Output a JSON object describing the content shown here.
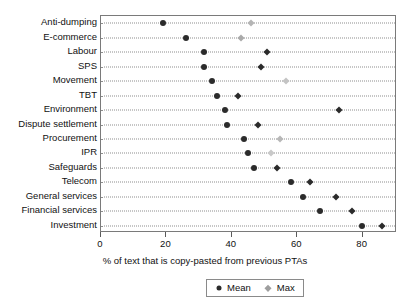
{
  "chart_data": {
    "type": "scatter",
    "title": "",
    "xlabel": "% of text that is copy-pasted from previous PTAs",
    "ylabel": "",
    "xlim": [
      0,
      90.5
    ],
    "xticks": [
      0,
      20,
      40,
      60,
      80
    ],
    "xticklabels": [
      "0",
      "20",
      "40",
      "60",
      "80"
    ],
    "grid": "horizontal-dotted",
    "legend_position": "below-axes-center",
    "categories": [
      "Anti-dumping",
      "E-commerce",
      "Labour",
      "SPS",
      "Movement",
      "TBT",
      "Environment",
      "Dispute settlement",
      "Procurement",
      "IPR",
      "Safeguards",
      "Telecom",
      "General services",
      "Financial services",
      "Investment"
    ],
    "series": [
      {
        "name": "Mean",
        "marker": "circle",
        "color": "#2b2b2b",
        "values": [
          19.0,
          26.0,
          31.5,
          31.5,
          33.8,
          35.5,
          38.0,
          38.5,
          43.7,
          44.9,
          46.7,
          58.0,
          61.7,
          66.9,
          79.7
        ]
      },
      {
        "name": "Max",
        "marker": "diamond",
        "color": "#9e9e9e",
        "values": [
          46.0,
          42.8,
          50.7,
          48.9,
          56.5,
          41.8,
          72.7,
          48.0,
          54.7,
          51.9,
          53.7,
          63.8,
          71.8,
          76.6,
          85.8
        ]
      }
    ],
    "max_marker_shades": [
      "#b5b5b5",
      "#aaaaaa",
      "#2b2b2b",
      "#2b2b2b",
      "#c4c4c4",
      "#2b2b2b",
      "#2b2b2b",
      "#2b2b2b",
      "#b8b8b8",
      "#c9c9c9",
      "#2b2b2b",
      "#2b2b2b",
      "#2b2b2b",
      "#2b2b2b",
      "#2b2b2b"
    ]
  },
  "legend": {
    "entries": [
      {
        "label": "Mean",
        "marker": "mean-circle-marker"
      },
      {
        "label": "Max",
        "marker": "max-diamond-marker"
      }
    ]
  },
  "colors": {
    "mean": "#2b2b2b",
    "max": "#9e9e9e",
    "axis": "#7a7a7a",
    "grid": "#8d8d8d",
    "background": "#ffffff"
  }
}
